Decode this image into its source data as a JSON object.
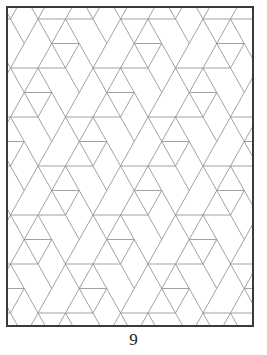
{
  "page": {
    "number": "9"
  },
  "figure": {
    "frame": {
      "x": 6,
      "y": 6,
      "width": 248,
      "height": 321,
      "border_color": "#3a3a3a",
      "border_width": 2
    },
    "lattice": {
      "origin_x": 30,
      "origin_y": 11,
      "dx": 27.5,
      "dy": 24.5,
      "rows": 14,
      "cols": 10,
      "line_color": "#8a8a8a",
      "line_width": 0.8
    }
  }
}
